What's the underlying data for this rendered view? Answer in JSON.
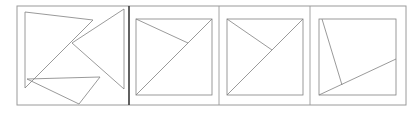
{
  "figure": {
    "background_color": "#ffffff",
    "stroke_color": "#808080",
    "divider_color": "#9a9a9a",
    "dark_divider_color": "#3a3a3a",
    "stroke_width": 0.8,
    "width": 418,
    "height": 116
  },
  "frame": {
    "label": "outer-frame",
    "x": 17,
    "y": 6,
    "width": 389,
    "height": 99
  },
  "dividers": [
    {
      "label": "divider-1",
      "x": 129,
      "color": "#3a3a3a",
      "width": 1.6
    },
    {
      "label": "divider-2",
      "x": 219,
      "color": "#9a9a9a",
      "width": 0.9
    },
    {
      "label": "divider-3",
      "x": 310,
      "color": "#9a9a9a",
      "width": 0.9
    }
  ],
  "panels": [
    {
      "id": "panel-1",
      "label": "Exploded tangram pieces",
      "kind": "pieces",
      "box": {
        "x": 25,
        "y": 12,
        "width": 96,
        "height": 88
      },
      "shapes": [
        {
          "name": "large-triangle",
          "type": "polygon",
          "points": "25,12 25,88 93,20"
        },
        {
          "name": "left-pointing-triangle",
          "type": "polygon",
          "points": "124,9 124,89 72,43"
        },
        {
          "name": "flat-bottom-triangle",
          "type": "polygon",
          "points": "27,79 100,77 79,104"
        }
      ]
    },
    {
      "id": "panel-2",
      "label": "Square with diagonal and midpoint cut",
      "kind": "square",
      "box": {
        "x": 136,
        "y": 19,
        "width": 76,
        "height": 76
      },
      "shapes": [
        {
          "name": "square-outline",
          "type": "rect",
          "x": 136,
          "y": 19,
          "width": 76,
          "height": 76
        },
        {
          "name": "main-diagonal",
          "type": "line",
          "x1": 136,
          "y1": 95,
          "x2": 212,
          "y2": 19
        },
        {
          "name": "cut-from-top-left",
          "type": "line",
          "x1": 136,
          "y1": 19,
          "x2": 188,
          "y2": 43
        }
      ]
    },
    {
      "id": "panel-3",
      "label": "Square with diagonal and offset cut",
      "kind": "square",
      "box": {
        "x": 227,
        "y": 19,
        "width": 76,
        "height": 76
      },
      "shapes": [
        {
          "name": "square-outline",
          "type": "rect",
          "x": 227,
          "y": 19,
          "width": 76,
          "height": 76
        },
        {
          "name": "main-diagonal",
          "type": "line",
          "x1": 227,
          "y1": 95,
          "x2": 303,
          "y2": 19
        },
        {
          "name": "cut-from-top-left",
          "type": "line",
          "x1": 227,
          "y1": 19,
          "x2": 272,
          "y2": 50
        }
      ]
    },
    {
      "id": "panel-4",
      "label": "Square with oblique cuts",
      "kind": "square",
      "box": {
        "x": 319,
        "y": 19,
        "width": 77,
        "height": 76
      },
      "shapes": [
        {
          "name": "square-outline",
          "type": "rect",
          "x": 319,
          "y": 19,
          "width": 77,
          "height": 76
        },
        {
          "name": "steep-cut",
          "type": "line",
          "x1": 322,
          "y1": 19,
          "x2": 342,
          "y2": 85
        },
        {
          "name": "shallow-cut",
          "type": "line",
          "x1": 319,
          "y1": 95,
          "x2": 396,
          "y2": 59
        }
      ]
    }
  ]
}
